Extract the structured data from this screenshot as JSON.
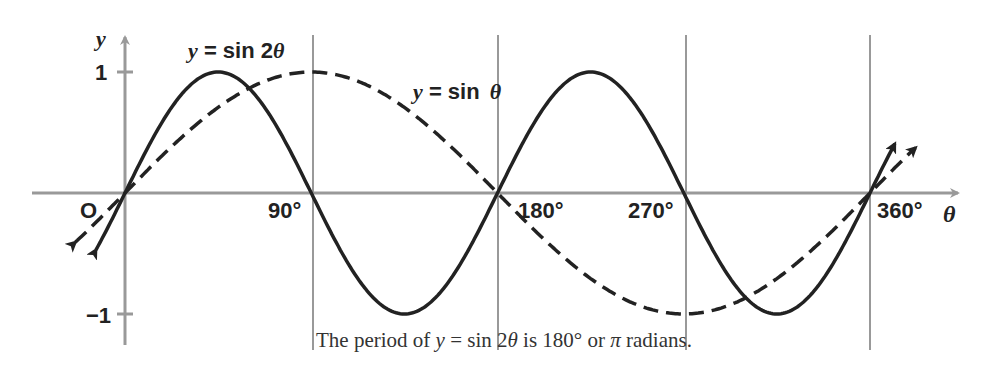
{
  "chart_data": {
    "type": "line",
    "title": "",
    "xlabel": "θ",
    "ylabel": "y",
    "x_ticks": [
      "90°",
      "180°",
      "270°",
      "360°"
    ],
    "y_ticks": [
      "1",
      "−1"
    ],
    "origin_label": "O",
    "xlim": [
      -10,
      380
    ],
    "ylim": [
      -1,
      1
    ],
    "grid": "vertical lines at 90°, 180°, 270°, 360°",
    "series": [
      {
        "name": "y = sin 2θ",
        "style": "solid",
        "x": [
          0,
          45,
          90,
          135,
          180,
          225,
          270,
          315,
          360
        ],
        "values": [
          0,
          1,
          0,
          -1,
          0,
          1,
          0,
          -1,
          0
        ]
      },
      {
        "name": "y = sin θ",
        "style": "dashed",
        "x": [
          0,
          90,
          180,
          270,
          360
        ],
        "values": [
          0,
          1,
          0,
          -1,
          0
        ]
      }
    ],
    "annotations": [
      "y = sin 2θ",
      "y = sin θ"
    ]
  },
  "labels": {
    "y_axis": "y",
    "x_axis": "θ",
    "origin": "O",
    "tick_1": "1",
    "tick_neg1": "−1",
    "tick_90": "90°",
    "tick_180": "180°",
    "tick_270": "270°",
    "tick_360": "360°",
    "sin2_label": "y = sin 2θ",
    "sin_label": "y = sin θ"
  },
  "caption": {
    "part1": "The period of ",
    "y": "y",
    "part2": " = sin 2",
    "theta": "θ",
    "part3": " is 180° or ",
    "pi": "π",
    "part4": " radians."
  }
}
